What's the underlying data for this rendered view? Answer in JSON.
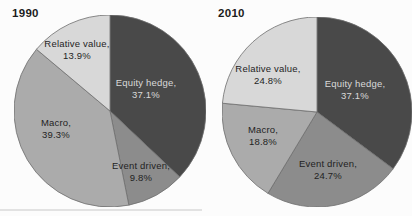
{
  "figure": {
    "background": "#fcfcfc",
    "slice_stroke": "#6f6f6f"
  },
  "chart_data": [
    {
      "type": "pie",
      "title": "1990",
      "slice_order": "clockwise from 12 o'clock",
      "slices": [
        {
          "label": "Equity hedge",
          "value_pct": 37.1,
          "display_label": "Equity hedge,",
          "display_value": "37.1%",
          "color": "#494949",
          "label_color": "#d9d9d9"
        },
        {
          "label": "Event driven",
          "value_pct": 9.8,
          "display_label": "Event driven,",
          "display_value": "9.8%",
          "color": "#8c8c8c",
          "label_color": "#1f1f1f"
        },
        {
          "label": "Macro",
          "value_pct": 39.3,
          "display_label": "Macro,",
          "display_value": "39.3%",
          "color": "#ababab",
          "label_color": "#1f1f1f"
        },
        {
          "label": "Relative value",
          "value_pct": 13.9,
          "display_label": "Relative value,",
          "display_value": "13.9%",
          "color": "#d8d8d8",
          "label_color": "#1f1f1f"
        }
      ]
    },
    {
      "type": "pie",
      "title": "2010",
      "slice_order": "clockwise from 12 o'clock",
      "slices": [
        {
          "label": "Equity hedge",
          "value_pct": 37.1,
          "display_label": "Equity hedge,",
          "display_value": "37.1%",
          "color": "#494949",
          "label_color": "#d9d9d9"
        },
        {
          "label": "Event driven",
          "value_pct": 24.7,
          "display_label": "Event driven,",
          "display_value": "24.7%",
          "color": "#8c8c8c",
          "label_color": "#1f1f1f"
        },
        {
          "label": "Macro",
          "value_pct": 18.8,
          "display_label": "Macro,",
          "display_value": "18.8%",
          "color": "#ababab",
          "label_color": "#1f1f1f"
        },
        {
          "label": "Relative value",
          "value_pct": 24.8,
          "display_label": "Relative value,",
          "display_value": "24.8%",
          "color": "#d8d8d8",
          "label_color": "#1f1f1f"
        }
      ]
    }
  ]
}
